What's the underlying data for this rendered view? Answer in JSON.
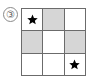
{
  "figure": {
    "label": "③",
    "label_plain": "3",
    "type": "shaded-grid-puzzle",
    "colors": {
      "shaded_cell": "#d6d6d6",
      "empty_cell": "#ffffff",
      "grid_line": "#6b6b6b",
      "star": "#000000",
      "label_text": "#5d5d5d"
    }
  },
  "grid": {
    "rows": 3,
    "columns": 3,
    "cells": [
      {
        "row": 1,
        "col": 1,
        "shaded": false,
        "star": true,
        "name": "cell-r1c1"
      },
      {
        "row": 1,
        "col": 2,
        "shaded": true,
        "star": false,
        "name": "cell-r1c2"
      },
      {
        "row": 1,
        "col": 3,
        "shaded": false,
        "star": false,
        "name": "cell-r1c3"
      },
      {
        "row": 2,
        "col": 1,
        "shaded": true,
        "star": false,
        "name": "cell-r2c1"
      },
      {
        "row": 2,
        "col": 2,
        "shaded": false,
        "star": false,
        "name": "cell-r2c2"
      },
      {
        "row": 2,
        "col": 3,
        "shaded": true,
        "star": false,
        "name": "cell-r2c3"
      },
      {
        "row": 3,
        "col": 1,
        "shaded": false,
        "star": false,
        "name": "cell-r3c1"
      },
      {
        "row": 3,
        "col": 2,
        "shaded": false,
        "star": false,
        "name": "cell-r3c2"
      },
      {
        "row": 3,
        "col": 3,
        "shaded": false,
        "star": true,
        "name": "cell-r3c3"
      }
    ]
  }
}
